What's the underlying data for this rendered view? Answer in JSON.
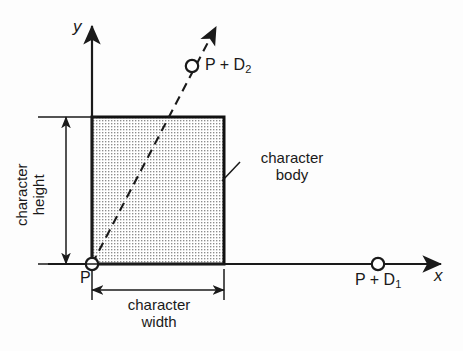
{
  "figure": {
    "background_color": "#fdfdfd",
    "ink_color": "#1a1a1a"
  },
  "axes": {
    "x_label": "x",
    "y_label": "y",
    "origin_label": "P"
  },
  "points": [
    {
      "name": "origin",
      "label": "P",
      "sub": ""
    },
    {
      "name": "vector-d1-endpoint",
      "label": "P + D",
      "sub": "1"
    },
    {
      "name": "vector-d2-endpoint",
      "label": "P + D",
      "sub": "2"
    }
  ],
  "point_labels": {
    "origin": "P",
    "d1_base": "P + D",
    "d1_sub": "1",
    "d2_base": "P + D",
    "d2_sub": "2"
  },
  "dimensions": {
    "height_line1": "character",
    "height_line2": "height",
    "width_line1": "character",
    "width_line2": "width"
  },
  "callouts": {
    "body_line1": "character",
    "body_line2": "body"
  },
  "box": {
    "name": "character-body",
    "fill_pattern": "dotted-grid",
    "fill_color": "#e9e9e9",
    "border_color": "#111111"
  }
}
